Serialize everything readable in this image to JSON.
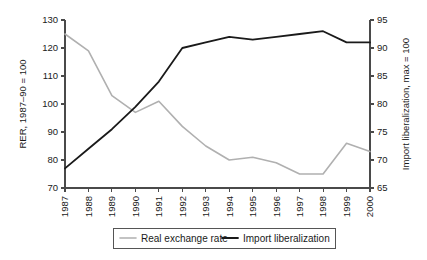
{
  "chart_data": {
    "type": "line",
    "title": "",
    "xlabel": "",
    "categories": [
      "1987",
      "1988",
      "1989",
      "1990",
      "1991",
      "1992",
      "1993",
      "1994",
      "1995",
      "1996",
      "1997",
      "1998",
      "1999",
      "2000"
    ],
    "left_axis": {
      "label": "RER, 1987–90 = 100",
      "ticks": [
        70,
        80,
        90,
        100,
        110,
        120,
        130
      ],
      "ylim": [
        70,
        130
      ]
    },
    "right_axis": {
      "label": "Import liberalization, max = 100",
      "ticks": [
        65,
        70,
        75,
        80,
        85,
        90,
        95
      ],
      "ylim": [
        65,
        95
      ]
    },
    "grid": false,
    "legend_position": "bottom",
    "series": [
      {
        "name": "Real exchange rate",
        "axis": "left",
        "color": "#b0b0b0",
        "values": [
          125,
          119,
          103,
          97,
          101,
          92,
          85,
          80,
          81,
          79,
          75,
          75,
          86,
          83
        ]
      },
      {
        "name": "Import liberalization",
        "axis": "right",
        "color": "#1a1a1a",
        "values_left_scale": [
          77,
          84,
          91,
          99,
          108,
          120,
          122,
          124,
          123,
          124,
          125,
          126,
          122,
          122
        ],
        "values": [
          68.5,
          72,
          75.5,
          79.5,
          84,
          90,
          91,
          92,
          91.5,
          92,
          92.5,
          93,
          91,
          91
        ]
      }
    ]
  },
  "legend": {
    "items": [
      {
        "label": "Real exchange rate",
        "color": "#b0b0b0"
      },
      {
        "label": "Import liberalization",
        "color": "#1a1a1a"
      }
    ]
  }
}
